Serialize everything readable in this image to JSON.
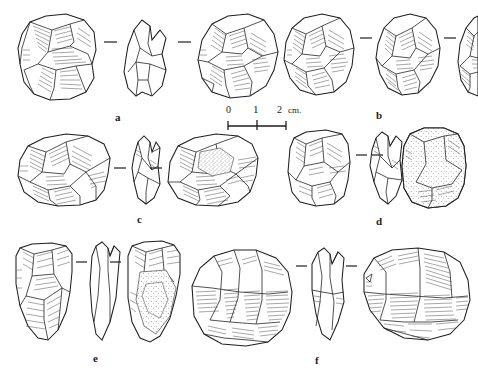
{
  "plate": {
    "title": "Lithic artifact plate",
    "description": "Line drawings of six stone tools, each illustrated in multiple views",
    "background_color": "#ffffff",
    "ink_color": "#2a2a2a"
  },
  "scale_bar": {
    "name": "scale-bar",
    "ticks": [
      "0",
      "1",
      "2"
    ],
    "tick_0": "0",
    "tick_1": "1",
    "tick_2": "2",
    "unit": "cm.",
    "total_label": "2 cm."
  },
  "specimens": [
    {
      "id": "a",
      "label": "a",
      "label_x": 115,
      "label_y": 112,
      "views": [
        "dorsal",
        "profile",
        "ventral"
      ],
      "view_count": 3
    },
    {
      "id": "b",
      "label": "b",
      "label_x": 376,
      "label_y": 110,
      "views": [
        "dorsal",
        "lateral",
        "ventral"
      ],
      "view_count": 3
    },
    {
      "id": "c",
      "label": "c",
      "label_x": 137,
      "label_y": 214,
      "views": [
        "dorsal",
        "profile",
        "ventral"
      ],
      "view_count": 3
    },
    {
      "id": "d",
      "label": "d",
      "label_x": 376,
      "label_y": 216,
      "views": [
        "dorsal",
        "profile",
        "cortical"
      ],
      "view_count": 3
    },
    {
      "id": "e",
      "label": "e",
      "label_x": 93,
      "label_y": 353,
      "views": [
        "dorsal",
        "profile",
        "cortical"
      ],
      "view_count": 3
    },
    {
      "id": "f",
      "label": "f",
      "label_x": 315,
      "label_y": 355,
      "views": [
        "dorsal",
        "profile",
        "ventral"
      ],
      "view_count": 3
    }
  ]
}
